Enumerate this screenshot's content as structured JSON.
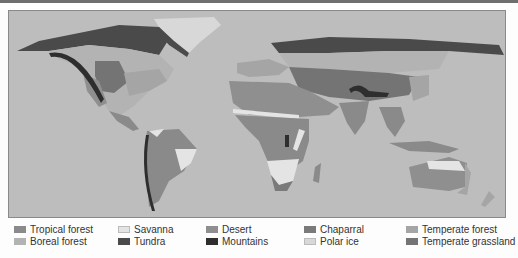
{
  "map": {
    "title": "World biomes",
    "ocean_color": "#bdbdbd",
    "biome_colors": {
      "tropical_forest": "#8a8a8a",
      "savanna": "#e4e4e4",
      "desert": "#8f8f8f",
      "chaparral": "#7a7a7a",
      "temperate_forest": "#a5a5a5",
      "boreal_forest": "#b3b3b3",
      "tundra": "#4a4a4a",
      "mountains": "#2e2e2e",
      "polar_ice": "#d8d8d8",
      "temperate_grassland": "#747474"
    }
  },
  "legend": {
    "items": [
      {
        "key": "tropical_forest",
        "label": "Tropical forest",
        "color": "#8a8a8a"
      },
      {
        "key": "boreal_forest",
        "label": "Boreal forest",
        "color": "#b3b3b3"
      },
      {
        "key": "savanna",
        "label": "Savanna",
        "color": "#e4e4e4"
      },
      {
        "key": "tundra",
        "label": "Tundra",
        "color": "#4a4a4a"
      },
      {
        "key": "desert",
        "label": "Desert",
        "color": "#8f8f8f"
      },
      {
        "key": "mountains",
        "label": "Mountains",
        "color": "#2e2e2e"
      },
      {
        "key": "chaparral",
        "label": "Chaparral",
        "color": "#7a7a7a"
      },
      {
        "key": "polar_ice",
        "label": "Polar ice",
        "color": "#d8d8d8"
      },
      {
        "key": "temperate_forest",
        "label": "Temperate forest",
        "color": "#a5a5a5"
      },
      {
        "key": "temperate_grassland",
        "label": "Temperate grassland",
        "color": "#747474"
      }
    ]
  }
}
